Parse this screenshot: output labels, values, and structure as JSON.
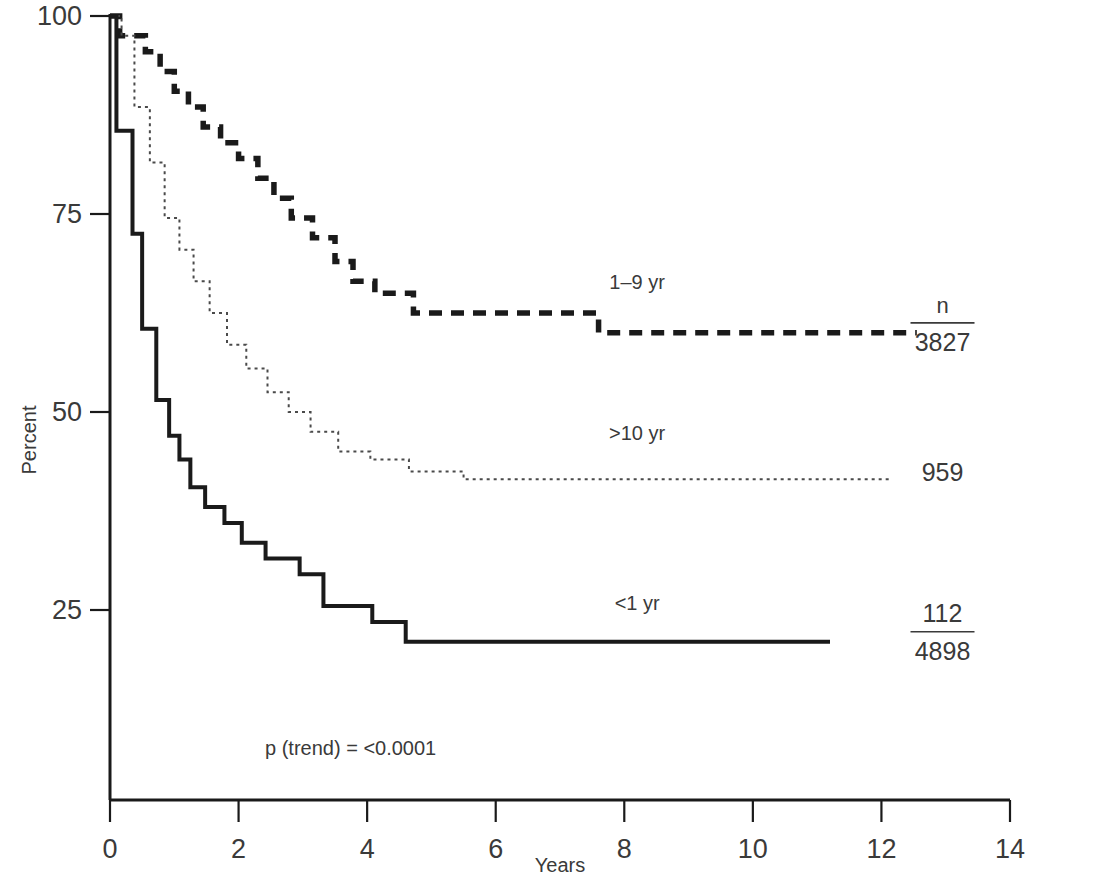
{
  "chart_data": {
    "type": "line",
    "title": "",
    "xlabel": "Years",
    "ylabel": "Percent",
    "xlim": [
      0,
      14
    ],
    "ylim": [
      0,
      100
    ],
    "xticks": [
      0,
      2,
      4,
      6,
      8,
      10,
      12,
      14
    ],
    "yticks": [
      25,
      50,
      75,
      100
    ],
    "xtick_labels": [
      "0",
      "2",
      "4",
      "6",
      "8",
      "10",
      "12",
      "14"
    ],
    "ytick_labels": [
      "25",
      "50",
      "75",
      "100"
    ],
    "grid": false,
    "legend_position": "inline-right",
    "annotation": "p (trend) = <0.0001",
    "n_column_header": "n",
    "series": [
      {
        "name": "1-9 yr",
        "label": "1–9 yr",
        "style": "dashed",
        "color": "#1a1a1a",
        "events": "3827",
        "events_display": "3827",
        "n_numerator": "n",
        "n_denominator": "3827",
        "label_x": 8.2,
        "label_y": 65.5,
        "n_x": 12.95,
        "n_y": 61.5,
        "steps": [
          [
            0.0,
            100.0
          ],
          [
            0.15,
            100.0
          ],
          [
            0.15,
            97.5
          ],
          [
            0.55,
            97.5
          ],
          [
            0.55,
            95.5
          ],
          [
            0.78,
            95.5
          ],
          [
            0.78,
            93.0
          ],
          [
            1.0,
            93.0
          ],
          [
            1.0,
            90.5
          ],
          [
            1.22,
            90.5
          ],
          [
            1.22,
            88.5
          ],
          [
            1.45,
            88.5
          ],
          [
            1.45,
            86.0
          ],
          [
            1.72,
            86.0
          ],
          [
            1.72,
            84.0
          ],
          [
            2.0,
            84.0
          ],
          [
            2.0,
            82.0
          ],
          [
            2.3,
            82.0
          ],
          [
            2.3,
            79.5
          ],
          [
            2.55,
            79.5
          ],
          [
            2.55,
            77.0
          ],
          [
            2.82,
            77.0
          ],
          [
            2.82,
            74.5
          ],
          [
            3.15,
            74.5
          ],
          [
            3.15,
            72.0
          ],
          [
            3.5,
            72.0
          ],
          [
            3.5,
            69.0
          ],
          [
            3.78,
            69.0
          ],
          [
            3.78,
            66.5
          ],
          [
            4.12,
            66.5
          ],
          [
            4.12,
            65.0
          ],
          [
            4.72,
            65.0
          ],
          [
            4.72,
            62.5
          ],
          [
            7.6,
            62.5
          ],
          [
            7.6,
            60.0
          ],
          [
            12.55,
            60.0
          ]
        ]
      },
      {
        "name": ">10 yr",
        "label": ">10 yr",
        "style": "dotted",
        "color": "#4a4a4a",
        "events": "959",
        "events_display": "959",
        "n_numerator": "",
        "n_denominator": "959",
        "label_x": 8.2,
        "label_y": 46.5,
        "n_x": 12.95,
        "n_y": 42.5,
        "steps": [
          [
            0.0,
            100.0
          ],
          [
            0.18,
            100.0
          ],
          [
            0.18,
            97.5
          ],
          [
            0.38,
            97.5
          ],
          [
            0.38,
            88.5
          ],
          [
            0.62,
            88.5
          ],
          [
            0.62,
            81.5
          ],
          [
            0.85,
            81.5
          ],
          [
            0.85,
            74.5
          ],
          [
            1.08,
            74.5
          ],
          [
            1.08,
            70.5
          ],
          [
            1.3,
            70.5
          ],
          [
            1.3,
            66.5
          ],
          [
            1.55,
            66.5
          ],
          [
            1.55,
            62.5
          ],
          [
            1.82,
            62.5
          ],
          [
            1.82,
            58.5
          ],
          [
            2.12,
            58.5
          ],
          [
            2.12,
            55.5
          ],
          [
            2.45,
            55.5
          ],
          [
            2.45,
            52.5
          ],
          [
            2.78,
            52.5
          ],
          [
            2.78,
            50.0
          ],
          [
            3.12,
            50.0
          ],
          [
            3.12,
            47.5
          ],
          [
            3.55,
            47.5
          ],
          [
            3.55,
            45.0
          ],
          [
            4.05,
            45.0
          ],
          [
            4.05,
            44.0
          ],
          [
            4.65,
            44.0
          ],
          [
            4.65,
            42.5
          ],
          [
            5.5,
            42.5
          ],
          [
            5.5,
            41.5
          ],
          [
            12.15,
            41.5
          ]
        ]
      },
      {
        "name": "<1 yr",
        "label": "<1 yr",
        "style": "solid",
        "color": "#1a1a1a",
        "events": "112",
        "events_display": "112",
        "n_numerator": "112",
        "n_denominator": "4898",
        "label_x": 8.2,
        "label_y": 25.0,
        "n_x": 12.95,
        "n_y": 22.5,
        "steps": [
          [
            0.0,
            100.0
          ],
          [
            0.1,
            100.0
          ],
          [
            0.1,
            85.5
          ],
          [
            0.35,
            85.5
          ],
          [
            0.35,
            72.5
          ],
          [
            0.5,
            72.5
          ],
          [
            0.5,
            60.5
          ],
          [
            0.72,
            60.5
          ],
          [
            0.72,
            51.5
          ],
          [
            0.92,
            51.5
          ],
          [
            0.92,
            47.0
          ],
          [
            1.08,
            47.0
          ],
          [
            1.08,
            44.0
          ],
          [
            1.25,
            44.0
          ],
          [
            1.25,
            40.5
          ],
          [
            1.48,
            40.5
          ],
          [
            1.48,
            38.0
          ],
          [
            1.78,
            38.0
          ],
          [
            1.78,
            36.0
          ],
          [
            2.05,
            36.0
          ],
          [
            2.05,
            33.5
          ],
          [
            2.42,
            33.5
          ],
          [
            2.42,
            31.5
          ],
          [
            2.95,
            31.5
          ],
          [
            2.95,
            29.5
          ],
          [
            3.32,
            29.5
          ],
          [
            3.32,
            25.5
          ],
          [
            4.08,
            25.5
          ],
          [
            4.08,
            23.5
          ],
          [
            4.6,
            23.5
          ],
          [
            4.6,
            21.0
          ],
          [
            11.2,
            21.0
          ]
        ]
      }
    ]
  },
  "axes": {
    "y_axis_title": "Percent",
    "x_axis_title": "Years"
  }
}
